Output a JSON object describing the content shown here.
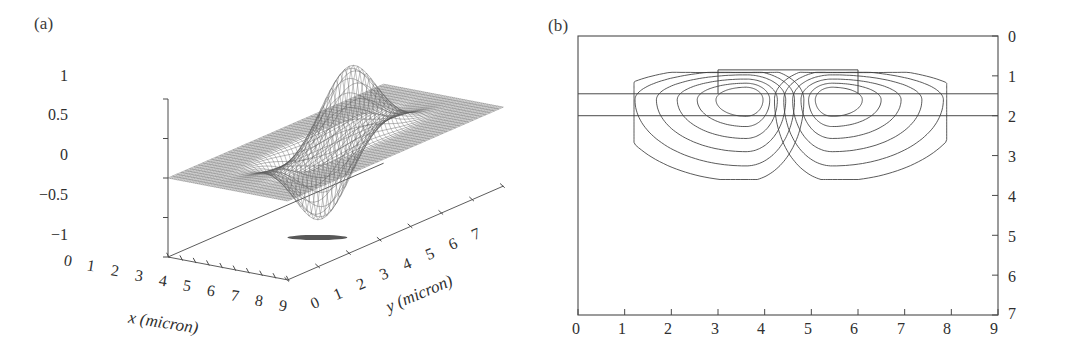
{
  "figure": {
    "panels": [
      {
        "tag": "(a)",
        "type": "surface3d",
        "zaxis": {
          "label_prefix": "Normalized ",
          "label_symbol": "E",
          "label_sub": "x",
          "ticks": [
            "1",
            "0.5",
            "0",
            "−0.5",
            "−1"
          ]
        },
        "xaxis": {
          "title": "x (micron)",
          "ticks": [
            "0",
            "1",
            "2",
            "3",
            "4",
            "5",
            "6",
            "7",
            "8",
            "9"
          ]
        },
        "yaxis": {
          "title": "y (micron)",
          "ticks": [
            "0",
            "1",
            "2",
            "3",
            "4",
            "5",
            "6",
            "7"
          ]
        }
      },
      {
        "tag": "(b)",
        "type": "contour",
        "xaxis": {
          "ticks": [
            "0",
            "1",
            "2",
            "3",
            "4",
            "5",
            "6",
            "7",
            "8",
            "9"
          ]
        },
        "yaxis": {
          "ticks": [
            "0",
            "1",
            "2",
            "3",
            "4",
            "5",
            "6",
            "7"
          ]
        }
      }
    ]
  },
  "chart_data": [
    {
      "type": "surface",
      "title": "(a)",
      "xlabel": "x (micron)",
      "ylabel": "y (micron)",
      "zlabel": "Normalized Ex",
      "xlim": [
        0,
        9
      ],
      "ylim": [
        0,
        7
      ],
      "zlim": [
        -1,
        1
      ],
      "xticks": [
        0,
        1,
        2,
        3,
        4,
        5,
        6,
        7,
        8,
        9
      ],
      "yticks": [
        0,
        1,
        2,
        3,
        4,
        5,
        6,
        7
      ],
      "zticks": [
        -1,
        -0.5,
        0,
        0.5,
        1
      ],
      "grid": false,
      "legend": "none",
      "description": "Wireframe mesh of an antisymmetric guided mode field: one negative lobe near x=3.5 reaching -1 and one positive lobe near x=5.5 reaching +1, flat near-zero background elsewhere.",
      "features": [
        {
          "name": "negative-lobe",
          "x": 3.5,
          "y": 3.5,
          "z": -1.0
        },
        {
          "name": "positive-lobe",
          "x": 5.5,
          "y": 3.5,
          "z": 1.0
        },
        {
          "name": "background-plane",
          "z": 0.0
        }
      ]
    },
    {
      "type": "contour",
      "title": "(b)",
      "xlabel": "",
      "ylabel": "",
      "xlim": [
        0,
        9
      ],
      "ylim": [
        7,
        0
      ],
      "xticks": [
        0,
        1,
        2,
        3,
        4,
        5,
        6,
        7,
        8,
        9
      ],
      "yticks": [
        0,
        1,
        2,
        3,
        4,
        5,
        6,
        7
      ],
      "y_axis_inverted": true,
      "grid": false,
      "legend": "none",
      "levels": [
        0.1,
        0.25,
        0.4,
        0.55,
        0.7,
        0.85
      ],
      "n_levels": 6,
      "structure": {
        "rib_x_range": [
          3.0,
          6.0
        ],
        "rib_y_range": [
          0.85,
          1.45
        ],
        "layer_line_1_y": 1.45,
        "layer_line_2_y": 2.0
      },
      "lobes": [
        {
          "name": "left-lobe",
          "center_x": 3.6,
          "center_y": 1.6,
          "sign": "negative"
        },
        {
          "name": "right-lobe",
          "center_x": 5.45,
          "center_y": 1.6,
          "sign": "positive"
        }
      ],
      "outer_contour_extent": {
        "x_min": 1.2,
        "x_max": 7.9,
        "y_max": 3.6
      },
      "description": "Cross-sectional contour map of the mode intensity inside a rib waveguide; two symmetric nested contour families centered under the rib, separated by a null at x=4.5."
    }
  ]
}
